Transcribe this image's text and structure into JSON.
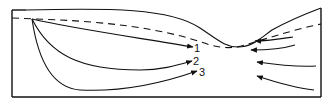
{
  "diagram": {
    "type": "flow-diagram",
    "labels": [
      "1",
      "2",
      "3"
    ],
    "colors": {
      "line": "#111111",
      "background": "#ffffff"
    },
    "left_streamlines": [
      {
        "label": "1",
        "from": "origin near upper-left",
        "to": "constriction (upper)"
      },
      {
        "label": "2",
        "from": "origin near upper-left",
        "to": "constriction (middle)"
      },
      {
        "label": "3",
        "from": "origin near upper-left",
        "to": "constriction (lower)"
      }
    ],
    "right_arrows_count": 4,
    "elements": {
      "upper_boundary": "solid curve with dip in center",
      "dashed_line": "dashed curve below upper boundary",
      "frame": "open box: left, bottom, right walls"
    }
  }
}
